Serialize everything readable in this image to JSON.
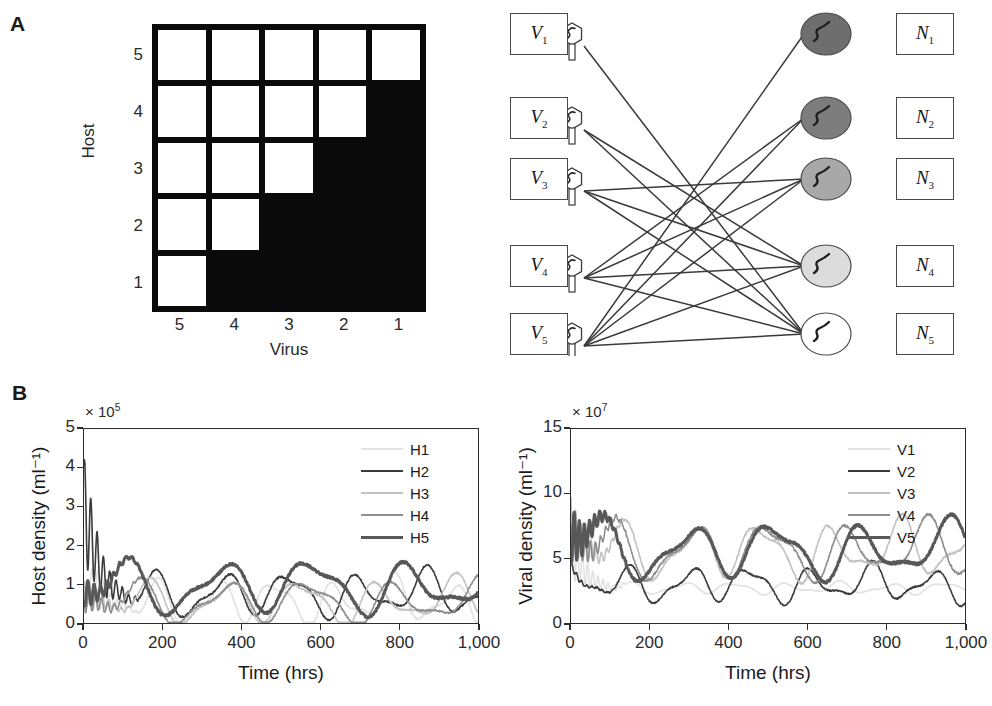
{
  "panels": {
    "a_label": "A",
    "b_label": "B"
  },
  "matrix": {
    "y_axis_title": "Host",
    "x_axis_title": "Virus",
    "row_labels": [
      "5",
      "4",
      "3",
      "2",
      "1"
    ],
    "col_labels": [
      "5",
      "4",
      "3",
      "2",
      "1"
    ],
    "cells": [
      [
        1,
        1,
        1,
        1,
        1
      ],
      [
        1,
        1,
        1,
        1,
        0
      ],
      [
        1,
        1,
        1,
        0,
        0
      ],
      [
        1,
        1,
        0,
        0,
        0
      ],
      [
        1,
        0,
        0,
        0,
        0
      ]
    ],
    "on_color": "#ffffff",
    "off_color": "#0a0a0a"
  },
  "network": {
    "virus_nodes": [
      {
        "label": "V",
        "sub": "1"
      },
      {
        "label": "V",
        "sub": "2"
      },
      {
        "label": "V",
        "sub": "3"
      },
      {
        "label": "V",
        "sub": "4"
      },
      {
        "label": "V",
        "sub": "5"
      }
    ],
    "host_nodes": [
      {
        "label": "N",
        "sub": "1",
        "fill": "#6e6e6e"
      },
      {
        "label": "N",
        "sub": "2",
        "fill": "#7d7d7d"
      },
      {
        "label": "N",
        "sub": "3",
        "fill": "#a8a8a8"
      },
      {
        "label": "N",
        "sub": "4",
        "fill": "#dcdcdc"
      },
      {
        "label": "N",
        "sub": "5",
        "fill": "#ffffff"
      }
    ],
    "edges": [
      [
        1,
        5
      ],
      [
        2,
        4
      ],
      [
        2,
        5
      ],
      [
        3,
        3
      ],
      [
        3,
        4
      ],
      [
        3,
        5
      ],
      [
        4,
        2
      ],
      [
        4,
        3
      ],
      [
        4,
        4
      ],
      [
        4,
        5
      ],
      [
        5,
        1
      ],
      [
        5,
        2
      ],
      [
        5,
        3
      ],
      [
        5,
        4
      ],
      [
        5,
        5
      ]
    ]
  },
  "chart_data": [
    {
      "type": "line",
      "id": "host-density",
      "title": "",
      "xlabel": "Time (hrs)",
      "ylabel": "Host density (ml⁻¹)",
      "y_multiplier": "× 10",
      "y_multiplier_exp": "5",
      "xlim": [
        0,
        1000
      ],
      "ylim": [
        0,
        5
      ],
      "xticks": [
        0,
        200,
        400,
        600,
        800,
        1000
      ],
      "xticklabels": [
        "0",
        "200",
        "400",
        "600",
        "800",
        "1,000"
      ],
      "yticks": [
        0,
        1,
        2,
        3,
        4,
        5
      ],
      "yticklabels": [
        "0",
        "1",
        "2",
        "3",
        "4",
        "5"
      ],
      "grid": false,
      "legend_position": "top-right",
      "series": [
        {
          "name": "H1",
          "color": "#e2e2e2",
          "width": 1.6
        },
        {
          "name": "H2",
          "color": "#3c3c3c",
          "width": 1.6
        },
        {
          "name": "H3",
          "color": "#c2c2c2",
          "width": 1.6
        },
        {
          "name": "H4",
          "color": "#8e8e8e",
          "width": 1.6
        },
        {
          "name": "H5",
          "color": "#585858",
          "width": 3.0
        }
      ]
    },
    {
      "type": "line",
      "id": "viral-density",
      "title": "",
      "xlabel": "Time (hrs)",
      "ylabel": "Viral density (ml⁻¹)",
      "y_multiplier": "× 10",
      "y_multiplier_exp": "7",
      "xlim": [
        0,
        1000
      ],
      "ylim": [
        0,
        15
      ],
      "xticks": [
        0,
        200,
        400,
        600,
        800,
        1000
      ],
      "xticklabels": [
        "0",
        "200",
        "400",
        "600",
        "800",
        "1,000"
      ],
      "yticks": [
        0,
        5,
        10,
        15
      ],
      "yticklabels": [
        "0",
        "5",
        "10",
        "15"
      ],
      "grid": false,
      "legend_position": "top-right",
      "series": [
        {
          "name": "V1",
          "color": "#e2e2e2",
          "width": 1.6
        },
        {
          "name": "V2",
          "color": "#3c3c3c",
          "width": 1.6
        },
        {
          "name": "V3",
          "color": "#c2c2c2",
          "width": 1.6
        },
        {
          "name": "V4",
          "color": "#8e8e8e",
          "width": 1.6
        },
        {
          "name": "V5",
          "color": "#585858",
          "width": 3.0
        }
      ]
    }
  ]
}
